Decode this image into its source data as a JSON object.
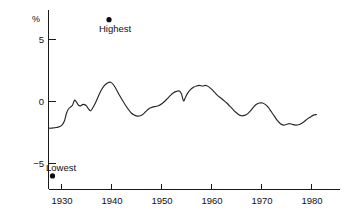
{
  "chart_data": {
    "type": "line",
    "title": "",
    "subtitle": "",
    "xlabel": "",
    "ylabel": "%",
    "xlim": [
      1926,
      1984
    ],
    "ylim": [
      -6.8,
      6.9
    ],
    "grid": false,
    "legend": "none",
    "y_ticks": [
      {
        "value": 5,
        "label": "5"
      },
      {
        "value": 0,
        "label": "0"
      },
      {
        "value": -5,
        "label": "−5"
      }
    ],
    "x_ticks": [
      {
        "value": 1930,
        "label": "1930"
      },
      {
        "value": 1940,
        "label": "1940"
      },
      {
        "value": 1950,
        "label": "1950"
      },
      {
        "value": 1960,
        "label": "1960"
      },
      {
        "value": 1970,
        "label": "1970"
      },
      {
        "value": 1980,
        "label": "1980"
      }
    ],
    "annotations": [
      {
        "name": "highest",
        "label": "Highest",
        "x": 1939.5,
        "y": 6.6,
        "label_position": "below"
      },
      {
        "name": "lowest",
        "label": "Lowest",
        "x": 1928.2,
        "y": -6.0,
        "label_position": "above"
      }
    ],
    "series": [
      {
        "name": "rate",
        "x": [
          1927.4,
          1928.0,
          1929.0,
          1930.0,
          1930.6,
          1931.0,
          1931.4,
          1931.8,
          1932.2,
          1932.6,
          1933.0,
          1933.4,
          1933.8,
          1934.2,
          1934.6,
          1935.0,
          1935.4,
          1935.8,
          1936.2,
          1936.8,
          1937.4,
          1938.0,
          1938.6,
          1939.2,
          1939.8,
          1940.4,
          1941.0,
          1941.6,
          1942.2,
          1942.8,
          1943.4,
          1944.0,
          1944.6,
          1945.2,
          1945.8,
          1946.4,
          1947.0,
          1947.6,
          1948.2,
          1948.8,
          1949.4,
          1950.0,
          1950.6,
          1951.2,
          1951.8,
          1952.4,
          1953.0,
          1953.6,
          1954.0,
          1954.4,
          1954.8,
          1955.2,
          1955.8,
          1956.4,
          1957.0,
          1957.6,
          1958.2,
          1958.8,
          1959.4,
          1960.0,
          1960.6,
          1961.2,
          1961.8,
          1962.4,
          1963.0,
          1963.6,
          1964.2,
          1964.8,
          1965.4,
          1966.0,
          1966.6,
          1967.2,
          1967.8,
          1968.4,
          1969.0,
          1969.6,
          1970.2,
          1970.8,
          1971.4,
          1972.0,
          1972.6,
          1973.2,
          1973.8,
          1974.4,
          1975.0,
          1975.6,
          1976.2,
          1976.8,
          1977.4,
          1978.0,
          1978.6,
          1979.2,
          1979.8,
          1980.4,
          1981.0
        ],
        "y": [
          -2.15,
          -2.15,
          -2.1,
          -1.95,
          -1.55,
          -0.95,
          -0.6,
          -0.45,
          -0.3,
          0.1,
          -0.05,
          -0.3,
          -0.35,
          -0.25,
          -0.25,
          -0.35,
          -0.6,
          -0.75,
          -0.55,
          -0.1,
          0.45,
          0.95,
          1.3,
          1.5,
          1.55,
          1.35,
          0.95,
          0.5,
          0.1,
          -0.3,
          -0.65,
          -0.95,
          -1.1,
          -1.18,
          -1.15,
          -1.0,
          -0.75,
          -0.55,
          -0.45,
          -0.4,
          -0.35,
          -0.2,
          0.0,
          0.25,
          0.5,
          0.7,
          0.82,
          0.85,
          0.6,
          0.05,
          0.35,
          0.65,
          0.95,
          1.15,
          1.25,
          1.3,
          1.25,
          1.3,
          1.2,
          1.0,
          0.75,
          0.5,
          0.3,
          0.1,
          -0.1,
          -0.35,
          -0.6,
          -0.85,
          -1.05,
          -1.15,
          -1.12,
          -1.0,
          -0.75,
          -0.45,
          -0.22,
          -0.12,
          -0.12,
          -0.25,
          -0.5,
          -0.85,
          -1.2,
          -1.55,
          -1.8,
          -1.9,
          -1.85,
          -1.78,
          -1.85,
          -1.9,
          -1.88,
          -1.78,
          -1.6,
          -1.4,
          -1.25,
          -1.1,
          -1.05
        ]
      }
    ]
  },
  "axis": {
    "y_axis_title": "%"
  }
}
